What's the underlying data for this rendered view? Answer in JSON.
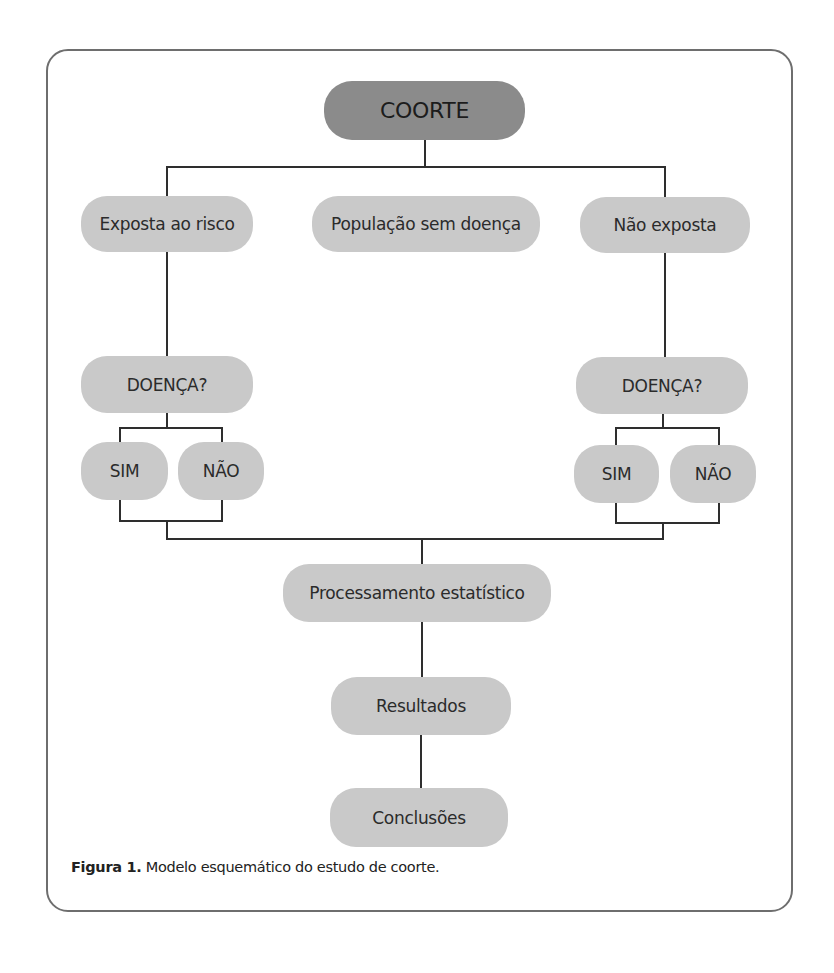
{
  "diagram": {
    "type": "flowchart",
    "title_node": "COORTE",
    "level1": {
      "left": "Exposta ao risco",
      "center": "População sem doença",
      "right": "Não exposta"
    },
    "left_branch": {
      "question": "DOENÇA?",
      "yes": "SIM",
      "no": "NÃO"
    },
    "right_branch": {
      "question": "DOENÇA?",
      "yes": "SIM",
      "no": "NÃO"
    },
    "processing": "Processamento estatístico",
    "results": "Resultados",
    "conclusions": "Conclusões",
    "colors": {
      "root_fill": "#8b8b8b",
      "node_fill": "#c9c9c9",
      "line": "#2e2e2e",
      "frame": "#6e6e6e",
      "text": "#2b2b2b"
    }
  },
  "caption": {
    "label": "Figura 1.",
    "text": " Modelo esquemático do estudo de coorte."
  }
}
